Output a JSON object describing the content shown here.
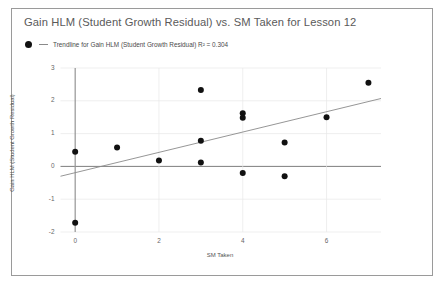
{
  "chart_data": {
    "type": "scatter",
    "title": "Gain HLM (Student Growth Residual) vs. SM Taken for Lesson 12",
    "xlabel": "SM Taken",
    "ylabel": "Gain HLM (Student Growth Residual)",
    "xlim": [
      -0.35,
      7.3
    ],
    "ylim": [
      -2,
      3
    ],
    "xticks": [
      0,
      2,
      4,
      6
    ],
    "yticks": [
      -2,
      -1,
      0,
      1,
      2,
      3
    ],
    "grid": true,
    "legend_position": "top-left",
    "series": [
      {
        "name": "Gain HLM (Student Growth Residual)",
        "marker": "circle",
        "color": "#111111",
        "points": [
          {
            "x": 0,
            "y": 0.45
          },
          {
            "x": 0,
            "y": -1.72
          },
          {
            "x": 1,
            "y": 0.58
          },
          {
            "x": 2,
            "y": 0.18
          },
          {
            "x": 3,
            "y": 2.33
          },
          {
            "x": 3,
            "y": 0.78
          },
          {
            "x": 3,
            "y": 0.12
          },
          {
            "x": 4,
            "y": 1.62
          },
          {
            "x": 4,
            "y": 1.48
          },
          {
            "x": 4,
            "y": -0.2
          },
          {
            "x": 5,
            "y": 0.73
          },
          {
            "x": 5,
            "y": -0.3
          },
          {
            "x": 6,
            "y": 1.5
          },
          {
            "x": 7,
            "y": 2.55
          }
        ]
      }
    ],
    "trendline": {
      "label": "Trendline for Gain HLM (Student Growth Residual) R² = 0.304",
      "r_squared": 0.304,
      "color": "#8a8a8a",
      "x_start": -0.35,
      "y_start": -0.3,
      "x_end": 7.3,
      "y_end": 2.07
    },
    "legend_entries": [
      {
        "marker": "circle-and-line",
        "label": "Trendline for Gain HLM (Student Growth Residual) R² = 0.304"
      }
    ]
  }
}
